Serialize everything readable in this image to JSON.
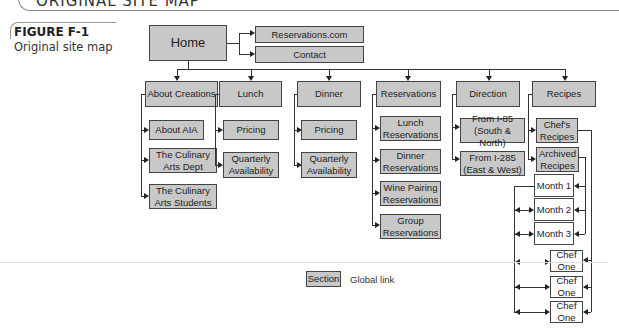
{
  "header": {
    "title": "ORIGINAL SITE MAP"
  },
  "figure": {
    "label": "FIGURE F-1",
    "caption": "Original site map"
  },
  "home": {
    "label": "Home"
  },
  "global_links": [
    "Reservations.com",
    "Contact"
  ],
  "sections": [
    {
      "label": "About Creations",
      "children": [
        "About AIA",
        "The Culinary Arts Dept",
        "The Culinary Arts Students"
      ]
    },
    {
      "label": "Lunch",
      "children": [
        "Pricing",
        "Quarterly Availability"
      ]
    },
    {
      "label": "Dinner",
      "children": [
        "Pricing",
        "Quarterly Availability"
      ]
    },
    {
      "label": "Reservations",
      "children": [
        "Lunch Reservations",
        "Dinner Reservations",
        "Wine Pairing Reservations",
        "Group Reservations"
      ]
    },
    {
      "label": "Direction",
      "children": [
        "From I-85 (South & North)",
        "From I-285 (East & West)"
      ]
    },
    {
      "label": "Recipes",
      "children": [
        "Chef's Recipes",
        "Archived Recipes"
      ]
    }
  ],
  "recipe_pages": {
    "months": [
      "Month 1",
      "Month 2",
      "Month 3"
    ],
    "chefs": [
      "Chef One",
      "Chef One",
      "Chef One"
    ]
  },
  "legend": {
    "section_label": "Section",
    "global_link_label": "Global link"
  },
  "colors": {
    "section_fill": "#c8c8c8",
    "page_fill": "#ffffff",
    "border": "#444444"
  }
}
